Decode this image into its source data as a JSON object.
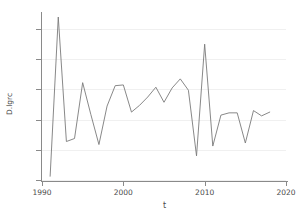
{
  "chart_data": {
    "type": "line",
    "title": "",
    "xlabel": "t",
    "ylabel": "D.lgrc",
    "xlim": [
      1990,
      2020
    ],
    "ylim": [
      -0.4,
      0.7
    ],
    "grid": true,
    "legend": null,
    "xticks": [
      1990,
      2000,
      2010,
      2020
    ],
    "xtick_labels": [
      "1990",
      "2000",
      "2010",
      "2020"
    ],
    "yticks": [
      -0.4,
      -0.2,
      0,
      0.2,
      0.4,
      0.6
    ],
    "ytick_labels": [
      "-.4",
      "-.2",
      "0",
      ".2",
      ".4",
      ".6"
    ],
    "line_color": "#7a7a7a",
    "series": [
      {
        "name": "D.lgrc",
        "x": [
          1991,
          1992,
          1993,
          1994,
          1995,
          1996,
          1997,
          1998,
          1999,
          2000,
          2001,
          2002,
          2003,
          2004,
          2005,
          2006,
          2007,
          2008,
          2009,
          2010,
          2011,
          2012,
          2013,
          2014,
          2015,
          2016,
          2017,
          2018
        ],
        "values": [
          -0.375,
          0.68,
          -0.145,
          -0.125,
          0.245,
          0.035,
          -0.165,
          0.09,
          0.225,
          0.23,
          0.05,
          0.095,
          0.15,
          0.215,
          0.115,
          0.21,
          0.27,
          0.195,
          -0.24,
          0.5,
          -0.175,
          0.03,
          0.045,
          0.045,
          -0.155,
          0.06,
          0.025,
          0.05
        ]
      }
    ]
  }
}
